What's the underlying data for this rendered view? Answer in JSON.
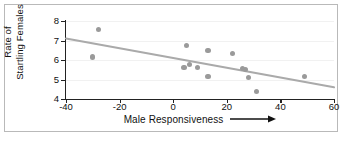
{
  "chart_data": {
    "type": "scatter",
    "title": "",
    "xlabel": "Male Responsiveness",
    "ylabel": "Rate of Startling Females",
    "ylabel_lines": [
      "Rate of",
      "Startling Females"
    ],
    "xlabel_has_arrow": true,
    "xlim": [
      -40,
      60
    ],
    "ylim": [
      4,
      8
    ],
    "xticks": [
      -40,
      -20,
      0,
      20,
      40,
      60
    ],
    "yticks": [
      4,
      5,
      6,
      7,
      8
    ],
    "xtick_labels": [
      "-40",
      "-20",
      "0",
      "20",
      "40",
      "60"
    ],
    "ytick_labels": [
      "4",
      "5",
      "6",
      "7",
      "8"
    ],
    "grid": false,
    "legend": "none",
    "points": [
      {
        "x": -28,
        "y": 7.55
      },
      {
        "x": -30,
        "y": 6.15
      },
      {
        "x": 5,
        "y": 6.75
      },
      {
        "x": 13,
        "y": 6.48
      },
      {
        "x": 22,
        "y": 6.33
      },
      {
        "x": 4,
        "y": 5.63
      },
      {
        "x": 6,
        "y": 5.75
      },
      {
        "x": 9,
        "y": 5.6
      },
      {
        "x": 13,
        "y": 5.17
      },
      {
        "x": 27,
        "y": 5.52
      },
      {
        "x": 28,
        "y": 5.12
      },
      {
        "x": 31,
        "y": 4.4
      },
      {
        "x": 49,
        "y": 5.15
      },
      {
        "x": 26,
        "y": 5.55
      }
    ],
    "trendline": {
      "x0": -40,
      "y0": 7.1,
      "x1": 60,
      "y1": 4.6
    },
    "colors": {
      "point": "#9a9a9a",
      "trendline": "#aaaaaa",
      "axis": "#222222",
      "frame": "#b9b9b9",
      "background": "#ffffff"
    }
  }
}
